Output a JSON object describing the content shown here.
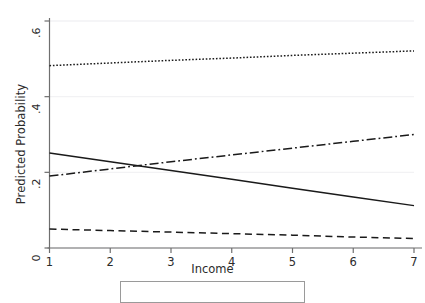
{
  "title": "Predicted Probabilities (cut off)",
  "axes": {
    "y_label": "Predicted Probability",
    "x_label": "Income",
    "y_ticks": [
      "0",
      ".2",
      ".4",
      ".6"
    ],
    "x_ticks": [
      "1",
      "2",
      "3",
      "4",
      "5",
      "6",
      "7"
    ]
  },
  "chart_data": {
    "type": "line",
    "title": "Predicted Probabilities (cut off)",
    "xlabel": "Income",
    "ylabel": "Predicted Probability",
    "xlim": [
      1,
      7
    ],
    "ylim": [
      0,
      0.6
    ],
    "x": [
      1,
      2,
      3,
      4,
      5,
      6,
      7
    ],
    "y_ticks": [
      0,
      0.2,
      0.4,
      0.6
    ],
    "x_ticks": [
      1,
      2,
      3,
      4,
      5,
      6,
      7
    ],
    "grid": "horizontal-faint",
    "legend_position": "bottom-outside-cropped",
    "series": [
      {
        "name": "series-1-dotted",
        "style": "dotted",
        "color": "#1a1a1a",
        "values": [
          0.482,
          0.489,
          0.496,
          0.502,
          0.509,
          0.515,
          0.521
        ]
      },
      {
        "name": "series-2-dash-dot",
        "style": "dash-dot",
        "color": "#1a1a1a",
        "values": [
          0.19,
          0.209,
          0.228,
          0.246,
          0.264,
          0.282,
          0.3
        ]
      },
      {
        "name": "series-3-solid",
        "style": "solid",
        "color": "#1a1a1a",
        "values": [
          0.251,
          0.228,
          0.205,
          0.182,
          0.158,
          0.135,
          0.112
        ]
      },
      {
        "name": "series-4-dashed",
        "style": "dashed",
        "color": "#1a1a1a",
        "values": [
          0.05,
          0.046,
          0.042,
          0.038,
          0.034,
          0.029,
          0.025
        ]
      }
    ]
  },
  "colors": {
    "line": "#1a1a1a",
    "axis": "#6f6f6f",
    "grid": "#f2f2f4",
    "text": "#2b2b2b"
  }
}
